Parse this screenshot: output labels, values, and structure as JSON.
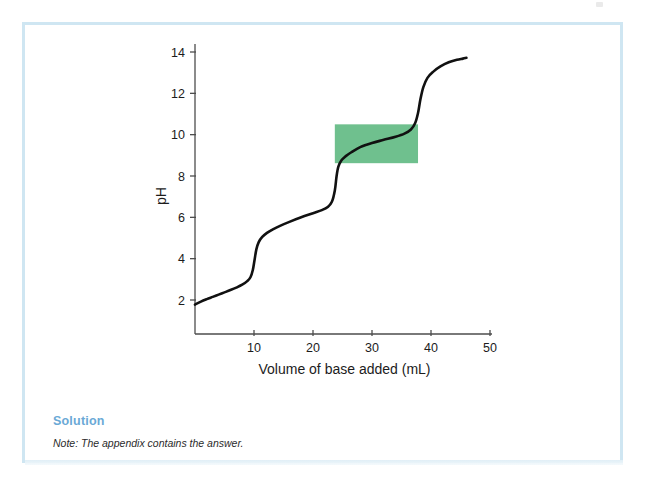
{
  "page": {
    "background_color": "#ffffff",
    "box_border_color": "#cfe6f2"
  },
  "solution": {
    "heading": "Solution",
    "heading_color": "#6aa9d6",
    "note": "Note: The appendix contains the answer."
  },
  "chart_data": {
    "type": "line",
    "title": "",
    "subtitle": "",
    "xlabel": "Volume of base added (mL)",
    "ylabel": "pH",
    "xlim": [
      0,
      50
    ],
    "ylim": [
      0,
      14
    ],
    "grid": false,
    "legend": null,
    "axis_color": "#4d4d4d",
    "curve_color": "#111111",
    "curve_width": 2.6,
    "xticks": [
      10,
      20,
      30,
      40,
      50
    ],
    "xtick_labels": [
      "10",
      "20",
      "30",
      "40",
      "50"
    ],
    "yticks": [
      2,
      4,
      6,
      8,
      10,
      12,
      14
    ],
    "ytick_labels": [
      "2",
      "4",
      "6",
      "8",
      "10",
      "12",
      "14"
    ],
    "series": [
      {
        "name": "Titration curve",
        "x": [
          0.0,
          1.0,
          2.0,
          3.0,
          4.0,
          5.0,
          6.0,
          7.0,
          8.0,
          8.8,
          9.4,
          9.8,
          10.1,
          10.4,
          10.8,
          11.4,
          12.2,
          13.2,
          14.5,
          16.0,
          18.0,
          20.0,
          21.5,
          22.5,
          23.2,
          23.7,
          24.0,
          24.3,
          24.8,
          25.5,
          26.5,
          28.0,
          30.0,
          32.0,
          34.0,
          35.5,
          36.6,
          37.3,
          37.8,
          38.2,
          38.7,
          39.4,
          40.4,
          41.6,
          43.0,
          44.4,
          45.4,
          46.0
        ],
        "y": [
          1.78,
          1.92,
          2.04,
          2.15,
          2.26,
          2.37,
          2.48,
          2.6,
          2.74,
          2.9,
          3.1,
          3.45,
          3.95,
          4.45,
          4.8,
          5.05,
          5.25,
          5.42,
          5.6,
          5.78,
          6.0,
          6.2,
          6.35,
          6.5,
          6.75,
          7.3,
          8.0,
          8.45,
          8.75,
          8.95,
          9.15,
          9.4,
          9.6,
          9.75,
          9.9,
          10.05,
          10.25,
          10.55,
          11.05,
          11.7,
          12.3,
          12.75,
          13.05,
          13.3,
          13.5,
          13.62,
          13.68,
          13.72
        ]
      }
    ],
    "annotations": [
      {
        "type": "rect",
        "name": "buffer-region-highlight",
        "color": "#63bb84",
        "opacity": 0.92,
        "x0": 23.7,
        "x1": 37.8,
        "y0": 8.62,
        "y1": 10.5
      }
    ]
  }
}
